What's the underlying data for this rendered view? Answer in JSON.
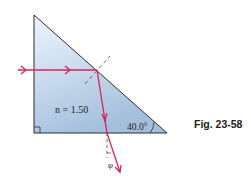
{
  "figure": {
    "caption": "Fig. 23-58",
    "refractive_index_label": "n = 1.50",
    "angle_label": "40.0°",
    "exit_angle_symbol": "φ"
  },
  "colors": {
    "prism_fill_top": "#e3edf7",
    "prism_fill_bottom": "#a9c3df",
    "prism_edge": "#2b2b2b",
    "ray": "#d6245a",
    "normal_line": "#444444"
  }
}
